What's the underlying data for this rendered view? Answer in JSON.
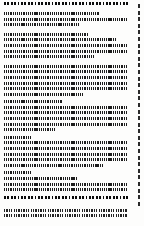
{
  "document": {
    "kind": "text-page-thumbnail",
    "page_background": "#fdfdfc",
    "text_color": "#1d1d1d",
    "margin_marker_color": "#2a2a2a",
    "title_line": {
      "style": "heading",
      "width_pct": 97
    },
    "blocks": [
      {
        "name": "paragraph-1",
        "style": "body",
        "line_widths_pct": [
          74,
          97,
          59
        ]
      },
      {
        "name": "paragraph-2",
        "style": "body",
        "line_widths_pct": [
          66,
          88,
          97,
          97,
          70
        ]
      },
      {
        "name": "paragraph-3",
        "style": "body",
        "line_widths_pct": [
          97,
          97,
          97,
          97,
          97,
          62
        ]
      },
      {
        "name": "paragraph-4",
        "style": "body",
        "line_widths_pct": [
          45,
          97,
          97,
          97,
          97,
          40
        ]
      },
      {
        "name": "paragraph-5",
        "style": "body",
        "line_widths_pct": [
          22,
          97,
          97,
          97,
          97,
          77
        ]
      },
      {
        "name": "paragraph-6",
        "style": "body",
        "line_widths_pct": [
          22,
          57,
          97,
          97
        ]
      }
    ],
    "footer": {
      "name": "footer",
      "rule_line": {
        "style": "heading",
        "width_pct": 97
      },
      "lines": [
        {
          "style": "foot",
          "width_pct": 97
        },
        {
          "style": "foot",
          "width_pct": 97
        }
      ]
    },
    "line_end_markers": {
      "name": "line-end-markers",
      "count": 31
    }
  }
}
